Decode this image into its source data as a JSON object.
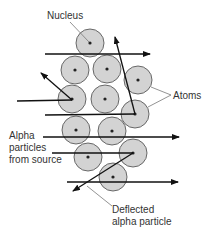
{
  "diagram": {
    "labels": {
      "nucleus": "Nucleus",
      "atoms": "Atoms",
      "alpha_line1": "Alpha",
      "alpha_line2": "particles",
      "alpha_line3": "from source",
      "deflected_line1": "Deflected",
      "deflected_line2": "alpha particle"
    },
    "colors": {
      "atom_fill": "#d3d3d3",
      "atom_stroke": "#5a5a5a",
      "nucleus": "#222222",
      "arrow": "#111111",
      "leader": "#777777",
      "text": "#333333"
    },
    "atoms": [
      {
        "cx": 90,
        "cy": 43
      },
      {
        "cx": 75,
        "cy": 70
      },
      {
        "cx": 107,
        "cy": 69
      },
      {
        "cx": 138,
        "cy": 80
      },
      {
        "cx": 72,
        "cy": 99
      },
      {
        "cx": 105,
        "cy": 99
      },
      {
        "cx": 135,
        "cy": 114
      },
      {
        "cx": 76,
        "cy": 130
      },
      {
        "cx": 112,
        "cy": 131
      },
      {
        "cx": 88,
        "cy": 157
      },
      {
        "cx": 133,
        "cy": 153
      },
      {
        "cx": 113,
        "cy": 177
      }
    ],
    "atom_radius": 14
  }
}
